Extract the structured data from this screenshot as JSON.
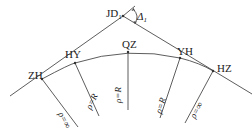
{
  "diagram": {
    "points": {
      "jd": {
        "label": "JD",
        "sub": "1"
      },
      "angle": {
        "label": "Δ",
        "sub": "1"
      },
      "zh": "ZH",
      "hy": "HY",
      "qz": "QZ",
      "yh": "YH",
      "hz": "HZ"
    },
    "radii": {
      "zh": "ρ=∞",
      "hy": "ρ=R",
      "qz": "ρ=R",
      "yh": "ρ=R",
      "hz": "ρ=∞"
    },
    "colors": {
      "line": "#333333",
      "text": "#222222",
      "background": "#ffffff"
    }
  }
}
